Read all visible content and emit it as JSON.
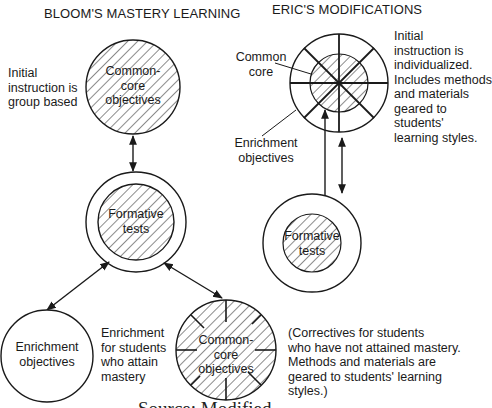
{
  "left_panel": {
    "title": "BLOOM'S MASTERY LEARNING",
    "top_circle_label": "Common-\ncore\nobjectives",
    "top_note": "Initial\ninstruction is\ngroup based",
    "formative_label": "Formative\ntests",
    "enrichment_circle_label": "Enrichment\nobjectives",
    "enrichment_note": "Enrichment\nfor students\nwho attain\nmastery",
    "corrective_circle_label": "Common-\ncore\nobjectives",
    "corrective_note": "(Correctives for students\nwho have not attained mastery.\nMethods and materials are\ngeared to students' learning\nstyles.)"
  },
  "right_panel": {
    "title": "ERIC'S MODIFICATIONS",
    "common_core_label": "Common\ncore",
    "enrichment_label": "Enrichment\nobjectives",
    "initial_note": "Initial\ninstruction is\nindividualized.\nIncludes methods\nand materials\ngeared to\nstudents'\nlearning styles.",
    "formative_label": "Formative\ntests"
  },
  "caption": {
    "text": "Source: Modified"
  },
  "colors": {
    "ink": "#1a1a1a",
    "background": "#ffffff"
  }
}
